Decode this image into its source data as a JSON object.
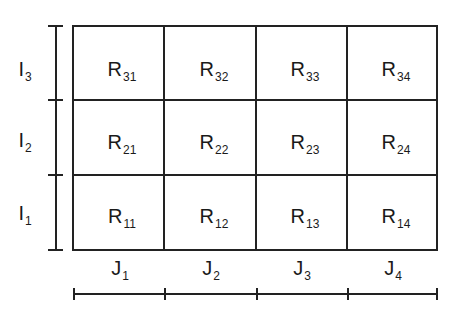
{
  "diagram": {
    "rows": [
      {
        "label": "I",
        "sub": "3",
        "cells": [
          {
            "label": "R",
            "sub": "31"
          },
          {
            "label": "R",
            "sub": "32"
          },
          {
            "label": "R",
            "sub": "33"
          },
          {
            "label": "R",
            "sub": "34"
          }
        ]
      },
      {
        "label": "I",
        "sub": "2",
        "cells": [
          {
            "label": "R",
            "sub": "21"
          },
          {
            "label": "R",
            "sub": "22"
          },
          {
            "label": "R",
            "sub": "23"
          },
          {
            "label": "R",
            "sub": "24"
          }
        ]
      },
      {
        "label": "I",
        "sub": "1",
        "cells": [
          {
            "label": "R",
            "sub": "11"
          },
          {
            "label": "R",
            "sub": "12"
          },
          {
            "label": "R",
            "sub": "13"
          },
          {
            "label": "R",
            "sub": "14"
          }
        ]
      }
    ],
    "columns": [
      {
        "label": "J",
        "sub": "1"
      },
      {
        "label": "J",
        "sub": "2"
      },
      {
        "label": "J",
        "sub": "3"
      },
      {
        "label": "J",
        "sub": "4"
      }
    ],
    "colors": {
      "line": "#222222",
      "background": "#ffffff"
    }
  }
}
